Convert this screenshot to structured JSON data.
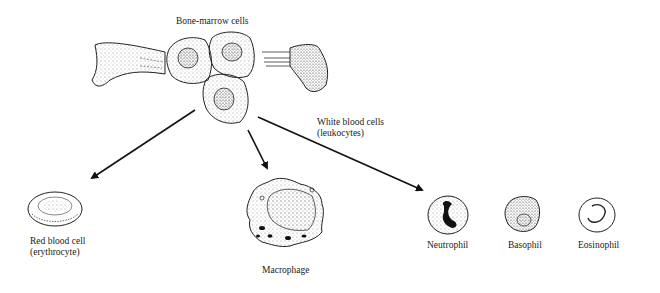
{
  "diagram": {
    "source": {
      "label": "Bone-marrow cells"
    },
    "branch_label": {
      "line1": "White blood cells",
      "line2": "(leukocytes)"
    },
    "products": [
      {
        "id": "rbc",
        "line1": "Red blood cell",
        "line2": "(erythrocyte)"
      },
      {
        "id": "macrophage",
        "line1": "Macrophage"
      },
      {
        "id": "neutrophil",
        "line1": "Neutrophil"
      },
      {
        "id": "basophil",
        "line1": "Basophil"
      },
      {
        "id": "eosinophil",
        "line1": "Eosinophil"
      }
    ],
    "colors": {
      "ink": "#111111",
      "background": "#ffffff"
    }
  }
}
